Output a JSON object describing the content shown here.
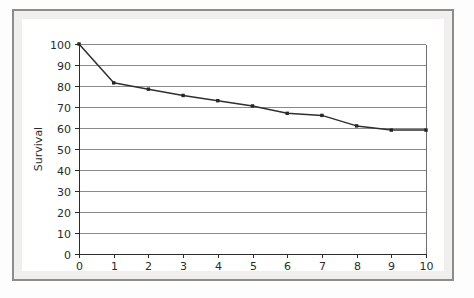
{
  "figure": {
    "background_color": "#ffffff",
    "frame_color": "#8c8c8c",
    "mat_color": "#f0efee"
  },
  "chart_data": {
    "type": "line",
    "title": "",
    "subtitle": "",
    "xlabel": "Year",
    "ylabel": "Survival",
    "x": [
      0,
      1,
      2,
      3,
      4,
      5,
      6,
      7,
      8,
      9,
      10
    ],
    "values": [
      100,
      81.5,
      78.5,
      75.5,
      73,
      70.5,
      67,
      66,
      61,
      59,
      59
    ],
    "series": [
      {
        "name": "Survival",
        "values": [
          100,
          81.5,
          78.5,
          75.5,
          73,
          70.5,
          67,
          66,
          61,
          59,
          59
        ],
        "color": "#2f2f2f",
        "marker": "square"
      }
    ],
    "xlim": [
      0,
      10
    ],
    "ylim": [
      0,
      100
    ],
    "xticks": [
      0,
      1,
      2,
      3,
      4,
      5,
      6,
      7,
      8,
      9,
      10
    ],
    "yticks": [
      0,
      10,
      20,
      30,
      40,
      50,
      60,
      70,
      80,
      90,
      100
    ],
    "xtick_labels": [
      "0",
      "1",
      "2",
      "3",
      "4",
      "5",
      "6",
      "7",
      "8",
      "9",
      "10"
    ],
    "ytick_labels": [
      "0",
      "10",
      "20",
      "30",
      "40",
      "50",
      "60",
      "70",
      "80",
      "90",
      "100"
    ],
    "grid": {
      "horizontal": true,
      "vertical": false,
      "color": "#8a8a8a"
    },
    "legend": {
      "visible": false,
      "position": "none",
      "entries": []
    },
    "annotations": []
  }
}
